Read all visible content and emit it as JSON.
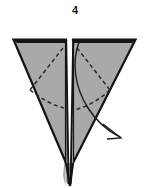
{
  "figure": {
    "step_number": "4",
    "caption": "",
    "kind": "origami-fold-diagram",
    "background_color": "#ffffff"
  },
  "colors": {
    "paper_fill": "#a9a9a9",
    "paper_fill_light": "#b4b4b4",
    "outline": "#141414",
    "crease_dashed": "#2a2a2a",
    "arrow": "#1c1c1c",
    "gap_white": "#ffffff",
    "number_color": "#1a1a1a"
  },
  "geometry": {
    "top_left": [
      13,
      39
    ],
    "top_right": [
      136,
      39
    ],
    "apex": [
      70,
      186
    ],
    "center_gap_left": 66,
    "center_gap_right": 73,
    "top_edge_thickness": 4
  },
  "shapes": {
    "left_panel": {
      "name": "left-triangle-flap",
      "points": "15,41 66,41 66,160 15,41",
      "fill": "#a9a9a9"
    },
    "right_panel": {
      "name": "right-triangle-flap",
      "points": "73,41 134,41 73,160 73,41",
      "fill": "#a9a9a9"
    }
  },
  "creases": {
    "left_upper_label": "left diagonal crease",
    "left_lower_label": "left lower crease",
    "right_upper_label": "right diagonal crease",
    "right_lower_label": "right lower crease",
    "dash_pattern": "4 3",
    "stroke_width": 1.5
  },
  "arrow": {
    "label": "fold-down-arrow",
    "direction": "down-right",
    "start": [
      79,
      42
    ],
    "end": [
      122,
      138
    ],
    "head_style": "open-v",
    "stroke_width": 1.4
  }
}
